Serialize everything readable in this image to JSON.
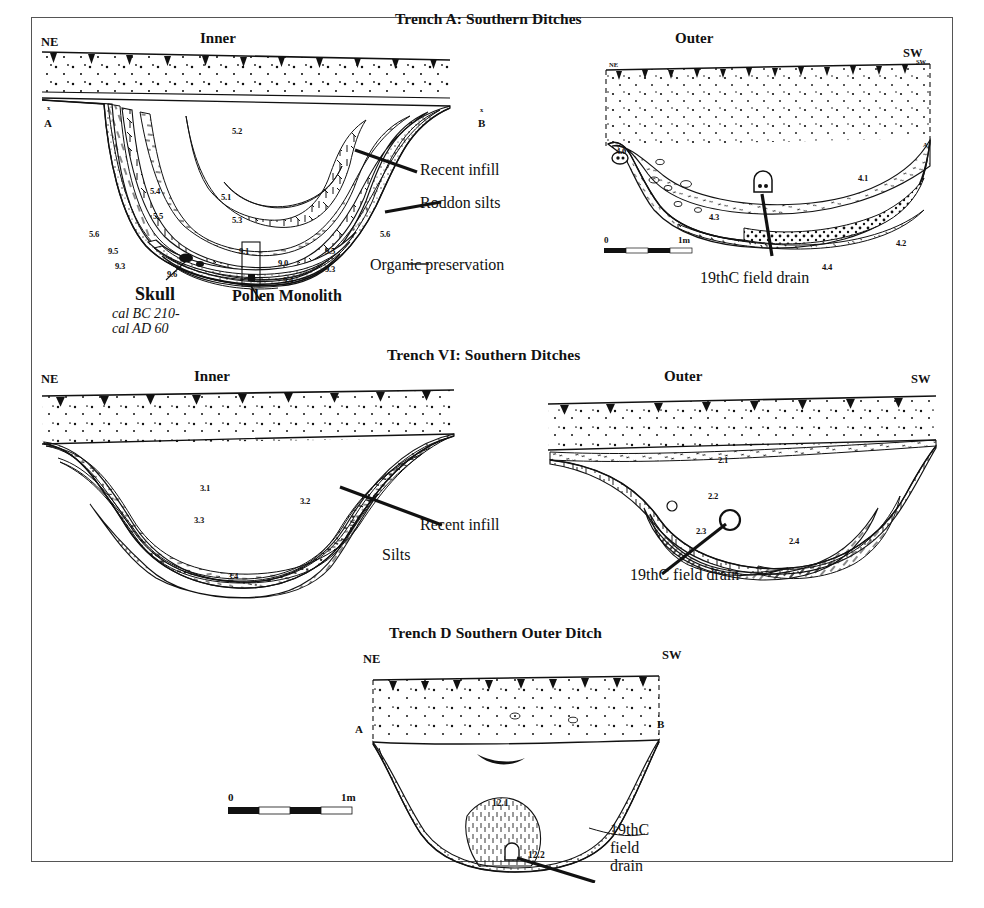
{
  "figure": {
    "background": "#ffffff",
    "frame_color": "#555555",
    "ink": "#000000"
  },
  "panels": [
    {
      "id": "trench-a",
      "title": "Trench A: Southern Ditches",
      "sections": [
        {
          "id": "trench-a-inner",
          "heading": "Inner",
          "left_dir": "NE",
          "right_dir": "",
          "corner_marks": [
            "x",
            "A",
            "x",
            "B"
          ],
          "contexts": [
            "5.2",
            "5.1",
            "5.4",
            "5.5",
            "5.3",
            "5.6",
            "5.6",
            "9.5",
            "9.3",
            "9.6",
            "9.1",
            "9.0",
            "9.5",
            "9.3",
            "9.4"
          ],
          "annotations": [
            "Recent infill",
            "Roddon silts",
            "Organic preservation"
          ],
          "finds": {
            "skull_label": "Skull",
            "skull_date_line1": "cal BC 210-",
            "skull_date_line2": "cal AD 60",
            "monolith_label": "Pollen Monolith"
          }
        },
        {
          "id": "trench-a-outer",
          "heading": "Outer",
          "left_dir": "NE",
          "right_dir": "SW",
          "corner_marks": [
            "NE",
            "SW",
            "A"
          ],
          "contexts": [
            "4.1",
            "4.3",
            "4.2",
            "4.4",
            "4.0"
          ],
          "annotations": [
            "19thC field drain"
          ],
          "scale_bar": {
            "left_label": "0",
            "right_label": "1m"
          }
        }
      ]
    },
    {
      "id": "trench-vi",
      "title": "Trench VI: Southern Ditches",
      "sections": [
        {
          "id": "trench-vi-inner",
          "heading": "Inner",
          "left_dir": "NE",
          "right_dir": "",
          "contexts": [
            "3.1",
            "3.2",
            "3.3",
            "3.4"
          ],
          "annotations": [
            "Recent infill",
            "Silts"
          ]
        },
        {
          "id": "trench-vi-outer",
          "heading": "Outer",
          "left_dir": "",
          "right_dir": "SW",
          "contexts": [
            "2.1",
            "2.2",
            "2.3",
            "2.4"
          ],
          "annotations": [
            "19thC field drain"
          ]
        }
      ]
    },
    {
      "id": "trench-d",
      "title": "Trench D Southern Outer Ditch",
      "sections": [
        {
          "id": "trench-d-section",
          "heading": "",
          "left_dir": "NE",
          "right_dir": "SW",
          "corner_marks": [
            "A",
            "B"
          ],
          "contexts": [
            "12.1",
            "12.2"
          ],
          "annotations": [
            "19thC",
            "field",
            "drain"
          ],
          "scale_bar": {
            "left_label": "0",
            "right_label": "1m"
          }
        }
      ]
    }
  ],
  "caption": ""
}
